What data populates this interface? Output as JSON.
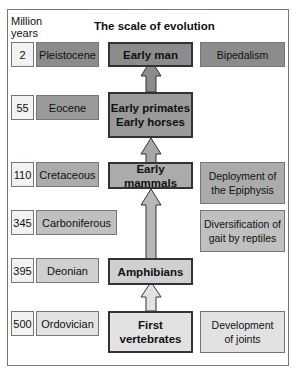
{
  "header": {
    "years_label_line1": "Million",
    "years_label_line2": "years",
    "title": "The scale of evolution"
  },
  "rows": [
    {
      "years": "2",
      "era": "Pleistocene",
      "milestone": "Early man",
      "trait": "Bipedalism"
    },
    {
      "years": "55",
      "era": "Eocene",
      "milestone_line1": "Early primates",
      "milestone_line2": "Early horses"
    },
    {
      "years": "110",
      "era": "Cretaceous",
      "milestone": "Early mammals",
      "trait_line1": "Deployment of",
      "trait_line2": "the Epiphysis"
    },
    {
      "years": "345",
      "era": "Carboniferous",
      "trait_line1": "Diversification of",
      "trait_line2": "gait by reptiles"
    },
    {
      "years": "395",
      "era": "Deonian",
      "milestone": "Amphibians"
    },
    {
      "years": "500",
      "era": "Ordovician",
      "milestone_line1": "First",
      "milestone_line2": "vertebrates",
      "trait_line1": "Development",
      "trait_line2": "of joints"
    }
  ],
  "colors": {
    "dark": "#8c8c8c",
    "mid": "#a8a8a8",
    "light": "#c4c4c4",
    "lighter": "#d6d6d6",
    "lightest": "#e2e2e2"
  }
}
